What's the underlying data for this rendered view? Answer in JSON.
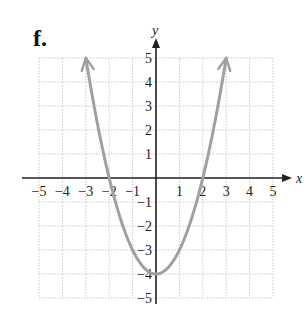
{
  "panel_label": "f.",
  "chart_data": {
    "type": "line",
    "title": "",
    "panel": "f.",
    "xlabel": "x",
    "ylabel": "y",
    "xlim": [
      -5,
      5
    ],
    "ylim": [
      -5,
      5
    ],
    "grid": true,
    "grid_style": "dotted",
    "x_ticks": [
      -5,
      -4,
      -3,
      -2,
      -1,
      1,
      2,
      3,
      4,
      5
    ],
    "x_tick_labels": [
      "−5",
      "−4",
      "−3",
      "−2",
      "−1",
      "1",
      "2",
      "3",
      "4",
      "5"
    ],
    "y_ticks": [
      5,
      4,
      3,
      2,
      1,
      -1,
      -2,
      -3,
      -4,
      -5
    ],
    "y_tick_labels": [
      "5",
      "4",
      "3",
      "2",
      "1",
      "−1",
      "−2",
      "−3",
      "−4",
      "−5"
    ],
    "legend": null,
    "series": [
      {
        "name": "y = x^2 - 4",
        "color": "#a0a0a0",
        "arrows": "both ends",
        "x": [
          -3,
          -2.5,
          -2,
          -1.5,
          -1,
          -0.5,
          0,
          0.5,
          1,
          1.5,
          2,
          2.5,
          3
        ],
        "y": [
          5,
          2.25,
          0,
          -1.75,
          -3,
          -3.75,
          -4,
          -3.75,
          -3,
          -1.75,
          0,
          2.25,
          5
        ]
      }
    ],
    "key_points": {
      "vertex": [
        0,
        -4
      ],
      "x_intercepts": [
        [
          -2,
          0
        ],
        [
          2,
          0
        ]
      ],
      "y_intercept": [
        0,
        -4
      ]
    }
  },
  "colors": {
    "curve": "#a0a0a0",
    "axis": "#222222",
    "grid": "#c8c8c8"
  }
}
